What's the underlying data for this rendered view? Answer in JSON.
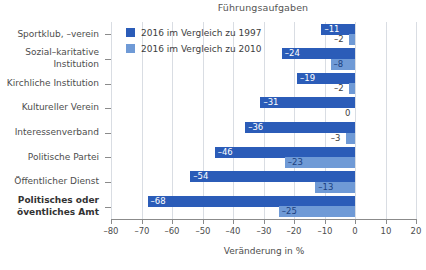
{
  "chart_data": {
    "type": "bar",
    "orientation": "horizontal",
    "title": "Führungsaufgaben",
    "xlabel": "Veränderung in %",
    "ylabel": "",
    "xlim": [
      -80,
      20
    ],
    "xticks": [
      -80,
      -70,
      -60,
      -50,
      -40,
      -30,
      -20,
      -10,
      0,
      10,
      20
    ],
    "xtick_labels": [
      "–80",
      "–70",
      "–60",
      "–50",
      "–40",
      "–30",
      "–20",
      "–10",
      "0",
      "10",
      "20"
    ],
    "grid": true,
    "legend_position": "upper-left-inside",
    "categories": [
      "Sportklub, –verein",
      "Sozial–karitative\nInstitution",
      "Kirchliche Institution",
      "Kultureller Verein",
      "Interessenverband",
      "Politische Partei",
      "Öffentlicher Dienst",
      "Politisches oder\növentliches Amt"
    ],
    "category_labels": [
      "Sportklub, –verein",
      "Sozial–karitative\nInstitution",
      "Kirchliche Institution",
      "Kultureller Verein",
      "Interessenverband",
      "Politische Partei",
      "Öffentlicher Dienst",
      "Politisches oder\növentliches Amt"
    ],
    "bold_categories": [
      "Politisches oder\növentliches Amt"
    ],
    "series": [
      {
        "name": "2016 im Vergleich zu 1997",
        "color": "#2b5cb8",
        "values": [
          -11,
          -24,
          -19,
          -31,
          -36,
          -46,
          -54,
          -68
        ],
        "value_labels": [
          "–11",
          "–24",
          "–19",
          "–31",
          "–36",
          "–46",
          "–54",
          "–68"
        ]
      },
      {
        "name": "2016 im Vergleich zu 2010",
        "color": "#6f9ad6",
        "values": [
          -2,
          -8,
          -2,
          0,
          -3,
          -23,
          -13,
          -25
        ],
        "value_labels": [
          "–2",
          "–8",
          "–2",
          "0",
          "–3",
          "–23",
          "–13",
          "–25"
        ]
      }
    ]
  },
  "colors": {
    "series_1": "#2b5cb8",
    "series_2": "#6f9ad6",
    "axis": "#8b8b8b",
    "grid": "#d9dde3",
    "text": "#4d4d4d"
  },
  "legend": {
    "items": [
      {
        "label": "2016 im Vergleich zu 1997",
        "swatch": "dark"
      },
      {
        "label": "2016 im Vergleich zu 2010",
        "swatch": "light"
      }
    ]
  },
  "bottom_caption": ""
}
